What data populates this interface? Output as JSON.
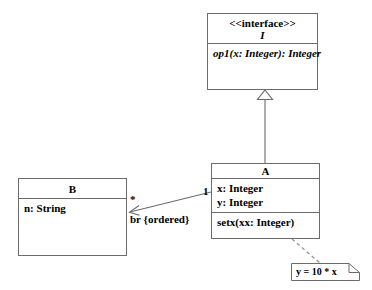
{
  "diagram": {
    "kind": "uml-class-diagram",
    "background_color": "#ffffff",
    "line_color": "#6b6b6b",
    "text_color": "#000000"
  },
  "interface_class": {
    "stereotype": "<<interface>>",
    "name": "I",
    "operations": [
      "op1(x: Integer): Integer"
    ]
  },
  "class_a": {
    "name": "A",
    "attributes": [
      "x: Integer",
      "y: Integer"
    ],
    "operations": [
      "setx(xx: Integer)"
    ]
  },
  "class_b": {
    "name": "B",
    "attributes": [
      "n: String"
    ],
    "operations": []
  },
  "note": {
    "text": "y = 10 * x"
  },
  "association": {
    "label": "br {ordered}",
    "source_multiplicity": "1",
    "target_multiplicity": "*"
  },
  "realization": {
    "arrow_type": "hollow-triangle"
  }
}
